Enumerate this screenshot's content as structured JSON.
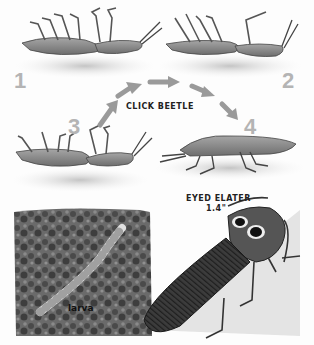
{
  "title": "CLICK BEETLE",
  "sequence": {
    "steps": [
      {
        "number": "1",
        "pose": "on back"
      },
      {
        "number": "2",
        "pose": "on back, arched"
      },
      {
        "number": "3",
        "pose": "on back, snapping"
      },
      {
        "number": "4",
        "pose": "landed upright"
      }
    ],
    "arrow_color": "#9a9a9a",
    "number_color": "#b4b4b4"
  },
  "specimen": {
    "name": "EYED ELATER",
    "size": "1.4\""
  },
  "larva": {
    "label": "larva"
  },
  "colors": {
    "background": "#fdfdfd",
    "beetle_body": "#8a8a8a",
    "shadow": "#d2d2d2",
    "soil": "#5c5c5c",
    "elater_body": "#3a3a3a"
  }
}
